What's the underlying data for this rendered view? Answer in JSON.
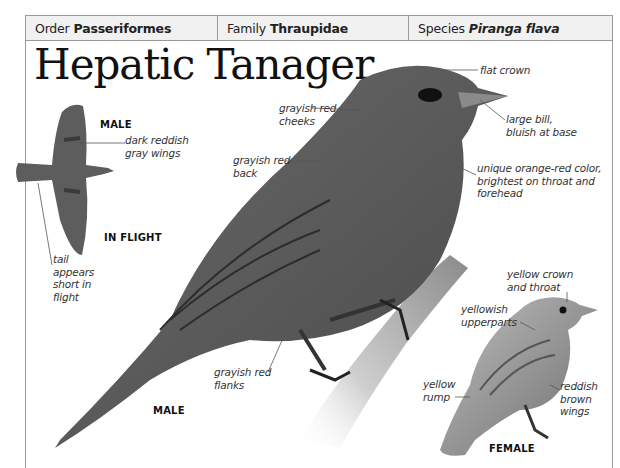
{
  "header": {
    "order": {
      "key": "Order",
      "value": "Passeriformes"
    },
    "family": {
      "key": "Family",
      "value": "Thraupidae"
    },
    "species": {
      "key": "Species",
      "value": "Piranga flava"
    }
  },
  "title": "Hepatic Tanager",
  "flight": {
    "caption_sex": "MALE",
    "caption_view": "IN FLIGHT",
    "labels": {
      "wings": [
        "dark reddish",
        "gray wings"
      ],
      "tail": [
        "tail",
        "appears",
        "short in",
        "flight"
      ]
    }
  },
  "male": {
    "caption": "MALE",
    "labels": {
      "crown": [
        "flat crown"
      ],
      "bill": [
        "large bill,",
        "bluish at base"
      ],
      "color": [
        "unique orange-red color,",
        "brightest on throat and",
        "forehead"
      ],
      "cheeks": [
        "grayish red",
        "cheeks"
      ],
      "back": [
        "grayish red",
        "back"
      ],
      "flanks": [
        "grayish red",
        "flanks"
      ]
    }
  },
  "female": {
    "caption": "FEMALE",
    "labels": {
      "crown": [
        "yellow crown",
        "and throat"
      ],
      "upperparts": [
        "yellowish",
        "upperparts"
      ],
      "rump": [
        "yellow",
        "rump"
      ],
      "wings": [
        "reddish",
        "brown",
        "wings"
      ]
    }
  },
  "colors": {
    "frame": "#9a9a9a",
    "header_bg": "#f1f1f1",
    "male_body": "#5a5a5a",
    "female_body": "#9c9c9c"
  }
}
